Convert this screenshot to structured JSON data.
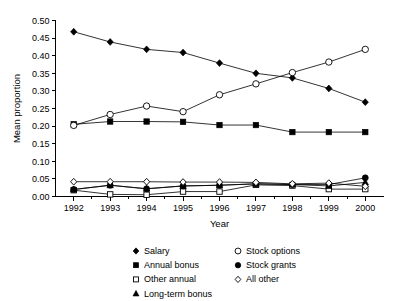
{
  "chart_data": {
    "type": "line",
    "title": "",
    "xlabel": "Year",
    "ylabel": "Mean proportion",
    "categories": [
      1992,
      1993,
      1994,
      1995,
      1996,
      1997,
      1998,
      1999,
      2000
    ],
    "x": [
      "1992",
      "1993",
      "1994",
      "1995",
      "1996",
      "1997",
      "1998",
      "1999",
      "2000"
    ],
    "xlim": [
      1991.5,
      2000.5
    ],
    "ylim": [
      0.0,
      0.5
    ],
    "yticks": [
      "0.00",
      "0.05",
      "0.10",
      "0.15",
      "0.20",
      "0.25",
      "0.30",
      "0.35",
      "0.40",
      "0.45",
      "0.50"
    ],
    "ytick_values": [
      0.0,
      0.05,
      0.1,
      0.15,
      0.2,
      0.25,
      0.3,
      0.35,
      0.4,
      0.45,
      0.5
    ],
    "grid": false,
    "legend_position": "bottom",
    "series": [
      {
        "name": "Salary",
        "marker": "filled-diamond",
        "values": [
          0.468,
          0.439,
          0.418,
          0.409,
          0.379,
          0.35,
          0.337,
          0.307,
          0.268
        ]
      },
      {
        "name": "Annual bonus",
        "marker": "filled-square",
        "values": [
          0.205,
          0.213,
          0.213,
          0.212,
          0.203,
          0.203,
          0.183,
          0.183,
          0.183
        ]
      },
      {
        "name": "Other annual",
        "marker": "open-square",
        "values": [
          0.018,
          0.006,
          0.005,
          0.014,
          0.014,
          0.033,
          0.031,
          0.021,
          0.021
        ]
      },
      {
        "name": "Long-term bonus",
        "marker": "filled-triangle",
        "values": [
          0.02,
          0.032,
          0.022,
          0.03,
          0.032,
          0.036,
          0.034,
          0.03,
          0.04
        ]
      },
      {
        "name": "Stock options",
        "marker": "open-circle",
        "values": [
          0.202,
          0.233,
          0.257,
          0.241,
          0.289,
          0.32,
          0.352,
          0.382,
          0.418
        ]
      },
      {
        "name": "Stock grants",
        "marker": "filled-circle",
        "values": [
          0.02,
          0.032,
          0.022,
          0.03,
          0.032,
          0.036,
          0.034,
          0.034,
          0.053
        ]
      },
      {
        "name": "All other",
        "marker": "open-diamond",
        "values": [
          0.042,
          0.042,
          0.042,
          0.041,
          0.041,
          0.04,
          0.036,
          0.038,
          0.029
        ]
      }
    ]
  },
  "legend": {
    "column1": [
      {
        "label": "Salary",
        "marker": "filled-diamond"
      },
      {
        "label": "Annual bonus",
        "marker": "filled-square"
      },
      {
        "label": "Other annual",
        "marker": "open-square"
      },
      {
        "label": "Long-term bonus",
        "marker": "filled-triangle"
      }
    ],
    "column2": [
      {
        "label": "Stock options",
        "marker": "open-circle"
      },
      {
        "label": "Stock grants",
        "marker": "filled-circle"
      },
      {
        "label": "All other",
        "marker": "open-diamond"
      }
    ]
  },
  "colors": {
    "ink": "#000000",
    "background": "#ffffff"
  }
}
